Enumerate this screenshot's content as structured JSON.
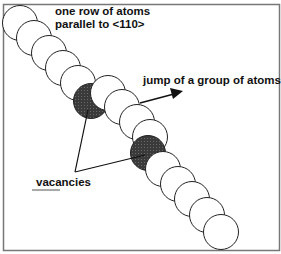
{
  "diagram": {
    "labels": {
      "row_line1": "one row of atoms",
      "row_line2": "parallel to <110>",
      "jump": "jump of a group of atoms",
      "vacancies": "vacancies"
    },
    "colors": {
      "frame": "#777777",
      "atom_fill": "#ffffff",
      "atom_stroke": "#222222",
      "vacancy_fill": "#3a3a3a",
      "text": "#111111"
    },
    "atoms": [
      {
        "cx": 20,
        "cy": 23,
        "type": "atom"
      },
      {
        "cx": 34,
        "cy": 38,
        "type": "atom"
      },
      {
        "cx": 49,
        "cy": 53,
        "type": "atom"
      },
      {
        "cx": 63,
        "cy": 68,
        "type": "atom"
      },
      {
        "cx": 78,
        "cy": 83,
        "type": "atom"
      },
      {
        "cx": 91,
        "cy": 101,
        "type": "vacancy"
      },
      {
        "cx": 108,
        "cy": 93,
        "type": "atom"
      },
      {
        "cx": 122,
        "cy": 107,
        "type": "atom"
      },
      {
        "cx": 137,
        "cy": 122,
        "type": "atom"
      },
      {
        "cx": 150,
        "cy": 137,
        "type": "atom"
      },
      {
        "cx": 148,
        "cy": 153,
        "type": "vacancy"
      },
      {
        "cx": 163,
        "cy": 169,
        "type": "atom"
      },
      {
        "cx": 178,
        "cy": 184,
        "type": "atom"
      },
      {
        "cx": 192,
        "cy": 199,
        "type": "atom"
      },
      {
        "cx": 207,
        "cy": 215,
        "type": "atom"
      },
      {
        "cx": 221,
        "cy": 232,
        "type": "atom"
      }
    ]
  }
}
